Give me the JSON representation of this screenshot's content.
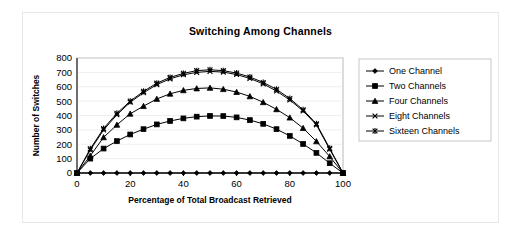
{
  "chart_data": {
    "type": "line",
    "title": "Switching Among Channels",
    "xlabel": "Percentage of Total Broadcast Retrieved",
    "ylabel": "Number of Switches",
    "xlim": [
      0,
      100
    ],
    "ylim": [
      0,
      800
    ],
    "xticks": [
      0,
      20,
      40,
      60,
      80,
      100
    ],
    "xtick_labels": [
      "0",
      "20",
      "40",
      "60",
      "80",
      "100"
    ],
    "yticks": [
      0,
      100,
      200,
      300,
      400,
      500,
      600,
      700,
      800
    ],
    "ytick_labels": [
      "0",
      "100",
      "200",
      "300",
      "400",
      "500",
      "600",
      "700",
      "800"
    ],
    "grid": true,
    "legend_position": "right",
    "x": [
      0,
      5,
      10,
      15,
      20,
      25,
      30,
      35,
      40,
      45,
      50,
      55,
      60,
      65,
      70,
      75,
      80,
      85,
      90,
      95,
      100
    ],
    "series": [
      {
        "name": "One Channel",
        "marker": "diamond",
        "color": "#000000",
        "values": [
          0,
          0,
          0,
          0,
          0,
          0,
          0,
          0,
          0,
          0,
          0,
          0,
          0,
          0,
          0,
          0,
          0,
          0,
          0,
          0,
          0
        ]
      },
      {
        "name": "Two Channels",
        "marker": "square",
        "color": "#000000",
        "values": [
          0,
          100,
          170,
          222,
          268,
          305,
          338,
          362,
          380,
          392,
          397,
          396,
          387,
          368,
          342,
          305,
          258,
          202,
          140,
          68,
          0
        ]
      },
      {
        "name": "Four Channels",
        "marker": "triangle",
        "color": "#000000",
        "values": [
          0,
          120,
          248,
          335,
          412,
          465,
          515,
          551,
          575,
          588,
          592,
          583,
          563,
          533,
          492,
          443,
          385,
          312,
          220,
          115,
          0
        ]
      },
      {
        "name": "Eight Channels",
        "marker": "x",
        "color": "#000000",
        "values": [
          0,
          160,
          300,
          405,
          492,
          558,
          615,
          655,
          683,
          700,
          707,
          702,
          685,
          658,
          620,
          570,
          508,
          432,
          335,
          165,
          0
        ]
      },
      {
        "name": "Sixteen Channels",
        "marker": "asterisk",
        "color": "#000000",
        "values": [
          0,
          168,
          310,
          415,
          500,
          568,
          625,
          665,
          693,
          712,
          718,
          712,
          695,
          668,
          630,
          582,
          518,
          440,
          342,
          172,
          0
        ]
      }
    ]
  },
  "legend": {
    "entries": [
      {
        "label": "One Channel"
      },
      {
        "label": "Two Channels"
      },
      {
        "label": "Four Channels"
      },
      {
        "label": "Eight Channels"
      },
      {
        "label": "Sixteen Channels"
      }
    ]
  }
}
